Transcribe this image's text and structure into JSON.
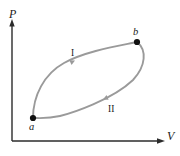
{
  "figure": {
    "kind": "pv-cycle-diagram",
    "background_color": "#ffffff",
    "axis_color": "#2b2b2b",
    "curve_color": "#9a9a9a",
    "point_color": "#101010",
    "text_color": "#1a1a1a",
    "axes": {
      "y_label": "P",
      "x_label": "V",
      "y_axis_x": 12,
      "y_axis_top": 21,
      "x_axis_y": 141,
      "x_axis_right": 163,
      "origin_x": 12,
      "origin_y": 141
    },
    "points": [
      {
        "name": "a",
        "label": "a",
        "cx": 33,
        "cy": 118,
        "r": 3.1,
        "label_x": 29,
        "label_y": 129
      },
      {
        "name": "b",
        "label": "b",
        "cx": 137,
        "cy": 42,
        "r": 3.1,
        "label_x": 133,
        "label_y": 35
      }
    ],
    "branches": [
      {
        "name": "path-I",
        "label": "I",
        "description": "upper path from a to b",
        "path": "M 33 118 C 33 96, 44 74, 64 63 C 86 51, 118 46, 137 42",
        "label_x": 72,
        "label_y": 57,
        "arrow": {
          "x": 74,
          "y": 61,
          "angle": -22
        }
      },
      {
        "name": "path-II",
        "label": "II",
        "description": "lower return path from b to a",
        "path": "M 137 42 C 147 50, 146 66, 133 80 C 112 100, 72 113, 60 116 C 47 119, 38 118, 33 118",
        "label_x": 110,
        "label_y": 111,
        "arrow": {
          "x": 104,
          "y": 99,
          "angle": 152
        }
      }
    ]
  }
}
